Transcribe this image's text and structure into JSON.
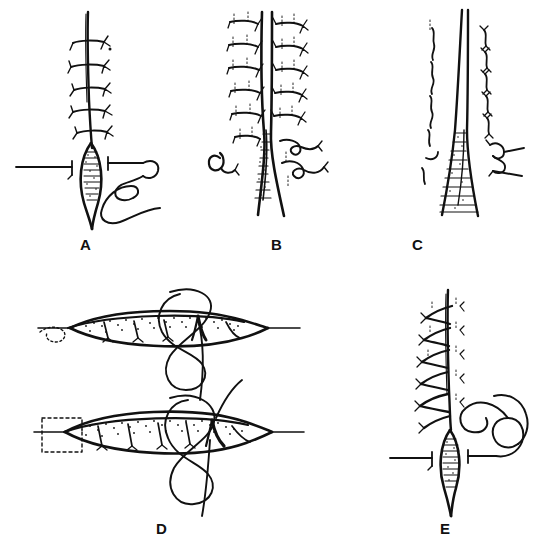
{
  "figure": {
    "kind": "surgical-wound-closure-illustration",
    "background_color": "#ffffff",
    "ink_color": "#111111",
    "width": 544,
    "height": 548,
    "panel_count": 5
  },
  "panels": [
    {
      "id": "A",
      "label": "A",
      "label_x": 86,
      "label_y": 245,
      "caption_text": "A",
      "content_description": "Vertical closed incision with five transverse interrupted sutures above a lens-shaped granulating wound; a curved needle with trailing suture thread lies to the right, with straight instrument shafts approaching from left and right."
    },
    {
      "id": "B",
      "label": "B",
      "label_x": 277,
      "label_y": 245,
      "caption_text": "B",
      "content_description": "Two parallel wound edges held by rows of small interrupted sutures on either side, converging inferiorly into a narrow stippled wound apex; small loop knots at the lower corners."
    },
    {
      "id": "C",
      "label": "C",
      "label_x": 418,
      "label_y": 245,
      "caption_text": "C",
      "content_description": "Narrowed closed wound line flanked by two vertical columns of short wavy stitch marks, widening into a stippled triangular defect at the base; a small double loop knot at lower right."
    },
    {
      "id": "D",
      "label": "D",
      "label_x": 162,
      "label_y": 530,
      "caption_text": "D",
      "content_description": "Two horizontal lens-shaped (elliptical) wounds shown in cross-section with stippled granulation tissue; vertical buried stitches inside each; a large looping suture thread passes around the middle of each wound. The upper wound has a dotted outline at the left tip, the lower wound a dashed rectangle at the left end."
    },
    {
      "id": "E",
      "label": "E",
      "label_x": 445,
      "label_y": 530,
      "caption_text": "E",
      "content_description": "Vertical wound closed with a continuous running (spiral) suture above a lens-shaped open wound; a looped suture thread with needle lies to the right; straight instrument shafts approach from left and right."
    }
  ],
  "legend": {
    "panel_labels": [
      "A",
      "B",
      "C",
      "D",
      "E"
    ]
  }
}
